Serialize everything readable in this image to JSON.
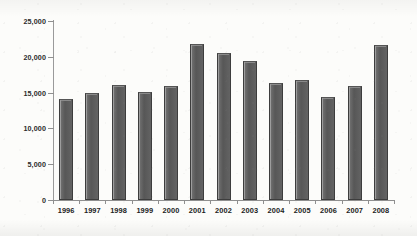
{
  "chart_data": {
    "type": "bar",
    "title": "",
    "subtitle": "",
    "xlabel": "",
    "ylabel": "",
    "categories": [
      "1996",
      "1997",
      "1998",
      "1999",
      "2000",
      "2001",
      "2002",
      "2003",
      "2004",
      "2005",
      "2006",
      "2007",
      "2008"
    ],
    "values": [
      14100,
      14950,
      16000,
      15100,
      15900,
      21800,
      20600,
      19400,
      16300,
      16800,
      14400,
      15900,
      21700
    ],
    "series": [
      {
        "name": "",
        "values": [
          14100,
          14950,
          16000,
          15100,
          15900,
          21800,
          20600,
          19400,
          16300,
          16800,
          14400,
          15900,
          21700
        ]
      }
    ],
    "ylim": [
      0,
      25000
    ],
    "ytick_labels": [
      "0",
      "5,000",
      "10,000",
      "15,000",
      "20,000",
      "25,000"
    ],
    "ytick_values": [
      0,
      5000,
      10000,
      15000,
      20000,
      25000
    ],
    "grid": false,
    "legend": false,
    "legend_position": "none",
    "bar_color": "#5e5e5e",
    "bar_edge_color": "#3d3d3d",
    "axis_color": "#8f8f8f",
    "background_color": "#fcfcfa",
    "text_color": "#222222",
    "annotations": []
  }
}
